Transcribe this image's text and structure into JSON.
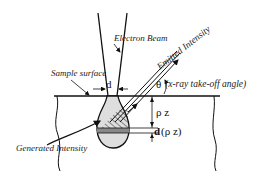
{
  "diagram": {
    "labels": {
      "electron_beam": "Electron Beam",
      "emitted_intensity": "Emitted Intensity",
      "sample_surface": "Sample surface",
      "generated_intensity": "Generated Intensity",
      "beam_diameter": "d",
      "theta": "θ",
      "takeoff_angle": "(x-ray take-off angle)",
      "depth": "ρ z",
      "layer_thickness_d": "d",
      "layer_thickness_rest": "(ρ z)"
    },
    "colors": {
      "line": "#111111",
      "volume_fill": "#dedede",
      "layer_fill": "#888888",
      "background": "#ffffff"
    }
  }
}
